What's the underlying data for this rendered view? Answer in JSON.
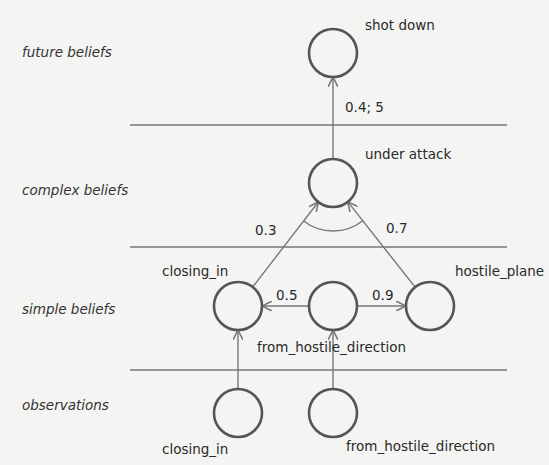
{
  "layers": [
    {
      "id": "future",
      "label": "future beliefs",
      "y": 57
    },
    {
      "id": "complex",
      "label": "complex beliefs",
      "y": 195
    },
    {
      "id": "simple",
      "label": "simple beliefs",
      "y": 314
    },
    {
      "id": "observations",
      "label": "observations",
      "y": 410
    }
  ],
  "dividers": [
    125,
    247,
    370
  ],
  "nodes": [
    {
      "id": "shot_down",
      "label": "shot down",
      "cx": 333,
      "cy": 53,
      "lx": 365,
      "ly": 30
    },
    {
      "id": "under_attack",
      "label": "under attack",
      "cx": 333,
      "cy": 183,
      "lx": 365,
      "ly": 159
    },
    {
      "id": "closing_in_belief",
      "label": "closing_in",
      "cx": 238,
      "cy": 306,
      "lx": 162,
      "ly": 276
    },
    {
      "id": "from_hostile_direction_belief",
      "label": "from_hostile_direction",
      "cx": 333,
      "cy": 306,
      "lx": 257,
      "ly": 352
    },
    {
      "id": "hostile_plane",
      "label": "hostile_plane",
      "cx": 430,
      "cy": 306,
      "lx": 455,
      "ly": 276
    },
    {
      "id": "closing_in_obs",
      "label": "closing_in",
      "cx": 238,
      "cy": 413,
      "lx": 162,
      "ly": 454
    },
    {
      "id": "from_hostile_direction_obs",
      "label": "from_hostile_direction",
      "cx": 333,
      "cy": 413,
      "lx": 346,
      "ly": 451
    }
  ],
  "edges": [
    {
      "from": "under_attack",
      "to": "shot_down",
      "label": "0.4; 5",
      "lx": 345,
      "ly": 112
    },
    {
      "from": "closing_in_belief",
      "to": "under_attack",
      "label": "0.3",
      "lx": 255,
      "ly": 235
    },
    {
      "from": "hostile_plane",
      "to": "under_attack",
      "label": "0.7",
      "lx": 386,
      "ly": 233
    },
    {
      "from": "from_hostile_direction_belief",
      "to": "closing_in_belief",
      "label": "0.5",
      "lx": 276,
      "ly": 300
    },
    {
      "from": "from_hostile_direction_belief",
      "to": "hostile_plane",
      "label": "0.9",
      "lx": 372,
      "ly": 300
    },
    {
      "from": "closing_in_obs",
      "to": "closing_in_belief",
      "label": ""
    },
    {
      "from": "from_hostile_direction_obs",
      "to": "from_hostile_direction_belief",
      "label": ""
    }
  ],
  "and_arc": {
    "between": [
      "closing_in_belief",
      "hostile_plane"
    ],
    "at": "under_attack"
  },
  "colors": {
    "background": "#f4f4f2",
    "node_stroke": "#555555",
    "edge": "#777777",
    "text": "#2a2a2a"
  }
}
